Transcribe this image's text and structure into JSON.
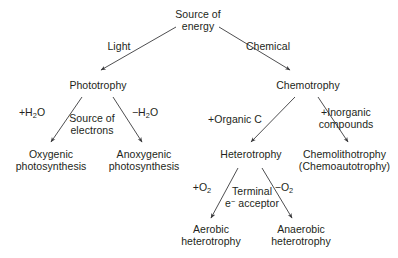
{
  "diagram": {
    "type": "flowchart",
    "line_color": "#3a3a3c",
    "text_color": "#231f20",
    "background_color": "#ffffff",
    "nodes": [
      {
        "id": "source-of-energy",
        "line1": "Source of",
        "line2": "energy"
      },
      {
        "id": "phototrophy",
        "line1": "Phototrophy",
        "line2": ""
      },
      {
        "id": "chemotrophy",
        "line1": "Chemotrophy",
        "line2": ""
      },
      {
        "id": "oxygenic-photosynthesis",
        "line1": "Oxygenic",
        "line2": "photosynthesis"
      },
      {
        "id": "anoxygenic-photosynthesis",
        "line1": "Anoxygenic",
        "line2": "photosynthesis"
      },
      {
        "id": "heterotrophy",
        "line1": "Heterotrophy",
        "line2": ""
      },
      {
        "id": "chemolithotrophy",
        "line1": "Chemolithotrophy",
        "line2": "(Chemoautotrophy)"
      },
      {
        "id": "aerobic-heterotrophy",
        "line1": "Aerobic",
        "line2": "heterotrophy"
      },
      {
        "id": "anaerobic-heterotrophy",
        "line1": "Anaerobic",
        "line2": "heterotrophy"
      }
    ],
    "edge_labels": [
      {
        "id": "light",
        "line1": "Light",
        "line2": ""
      },
      {
        "id": "chemical",
        "line1": "Chemical",
        "line2": ""
      },
      {
        "id": "plus-water",
        "line1": "+H₂O",
        "line2": ""
      },
      {
        "id": "minus-water",
        "line1": "−H₂O",
        "line2": ""
      },
      {
        "id": "source-of-electrons",
        "line1": "Source of",
        "line2": "electrons"
      },
      {
        "id": "plus-organic-c",
        "line1": "+Organic C",
        "line2": ""
      },
      {
        "id": "plus-inorganic",
        "line1": "+Inorganic",
        "line2": "compounds"
      },
      {
        "id": "plus-oxygen",
        "line1": "+O₂",
        "line2": ""
      },
      {
        "id": "minus-oxygen",
        "line1": "−O₂",
        "line2": ""
      },
      {
        "id": "terminal-acceptor",
        "line1": "Terminal",
        "line2": "e⁻ acceptor"
      }
    ],
    "edges": [
      {
        "id": "energy-to-phototrophy",
        "from": "source-of-energy",
        "to": "phototrophy",
        "label": "light"
      },
      {
        "id": "energy-to-chemotrophy",
        "from": "source-of-energy",
        "to": "chemotrophy",
        "label": "chemical"
      },
      {
        "id": "phototrophy-to-oxygenic",
        "from": "phototrophy",
        "to": "oxygenic-photosynthesis",
        "label": "plus-water"
      },
      {
        "id": "phototrophy-to-anoxygenic",
        "from": "phototrophy",
        "to": "anoxygenic-photosynthesis",
        "label": "minus-water"
      },
      {
        "id": "chemotrophy-to-heterotrophy",
        "from": "chemotrophy",
        "to": "heterotrophy",
        "label": "plus-organic-c"
      },
      {
        "id": "chemotrophy-to-chemolithotrophy",
        "from": "chemotrophy",
        "to": "chemolithotrophy",
        "label": "plus-inorganic"
      },
      {
        "id": "heterotrophy-to-aerobic",
        "from": "heterotrophy",
        "to": "aerobic-heterotrophy",
        "label": "plus-oxygen"
      },
      {
        "id": "heterotrophy-to-anaerobic",
        "from": "heterotrophy",
        "to": "anaerobic-heterotrophy",
        "label": "minus-oxygen"
      }
    ]
  }
}
